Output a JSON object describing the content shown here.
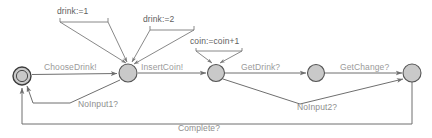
{
  "diagram": {
    "type": "state-machine",
    "canvas": {
      "width": 432,
      "height": 138
    },
    "colors": {
      "node_fill": "#c9c9c9",
      "node_stroke": "#555555",
      "edge": "#8d8d8d",
      "label_light": "#9a9a9a",
      "label_dark": "#606060",
      "background": "#ffffff"
    },
    "states": [
      {
        "id": "s0",
        "label": "",
        "shape": "double-circle",
        "cx": 22,
        "cy": 76,
        "r": 9
      },
      {
        "id": "s1",
        "label": "",
        "shape": "circle",
        "cx": 128,
        "cy": 73,
        "r": 9
      },
      {
        "id": "s2",
        "label": "",
        "shape": "circle",
        "cx": 216,
        "cy": 73,
        "r": 8.5
      },
      {
        "id": "s3",
        "label": "",
        "shape": "circle",
        "cx": 316,
        "cy": 73,
        "r": 8.5
      },
      {
        "id": "s4",
        "label": "",
        "shape": "circle",
        "cx": 412,
        "cy": 73,
        "r": 9
      }
    ],
    "transitions": [
      {
        "id": "t-choose-drink",
        "label": "ChooseDrink!",
        "from": "s0",
        "to": "s1",
        "label_x": 44,
        "label_y": 70
      },
      {
        "id": "t-insert-coin",
        "label": "InsertCoin!",
        "from": "s1",
        "to": "s2",
        "label_x": 141,
        "label_y": 70
      },
      {
        "id": "t-get-drink",
        "label": "GetDrink?",
        "from": "s2",
        "to": "s3",
        "label_x": 241,
        "label_y": 70
      },
      {
        "id": "t-get-change",
        "label": "GetChange?",
        "from": "s3",
        "to": "s4",
        "label_x": 340,
        "label_y": 70
      },
      {
        "id": "t-no-input-1",
        "label": "NoInput1?",
        "from": "s1",
        "to": "s0",
        "label_x": 78,
        "label_y": 107
      },
      {
        "id": "t-no-input-2",
        "label": "NoInput2?",
        "from": "s2",
        "to": "s4",
        "label_x": 297,
        "label_y": 110
      },
      {
        "id": "t-complete",
        "label": "Complete?",
        "from": "s4",
        "to": "s0",
        "label_x": 178,
        "label_y": 131
      }
    ],
    "assignments": [
      {
        "id": "a-drink-1",
        "label": "drink:=1",
        "target": "s1",
        "label_x": 57,
        "label_y": 14
      },
      {
        "id": "a-drink-2",
        "label": "drink:=2",
        "target": "s1",
        "label_x": 143,
        "label_y": 22
      },
      {
        "id": "a-coin-inc",
        "label": "coin:=coin+1",
        "target": "s2",
        "label_x": 190,
        "label_y": 44
      }
    ]
  }
}
